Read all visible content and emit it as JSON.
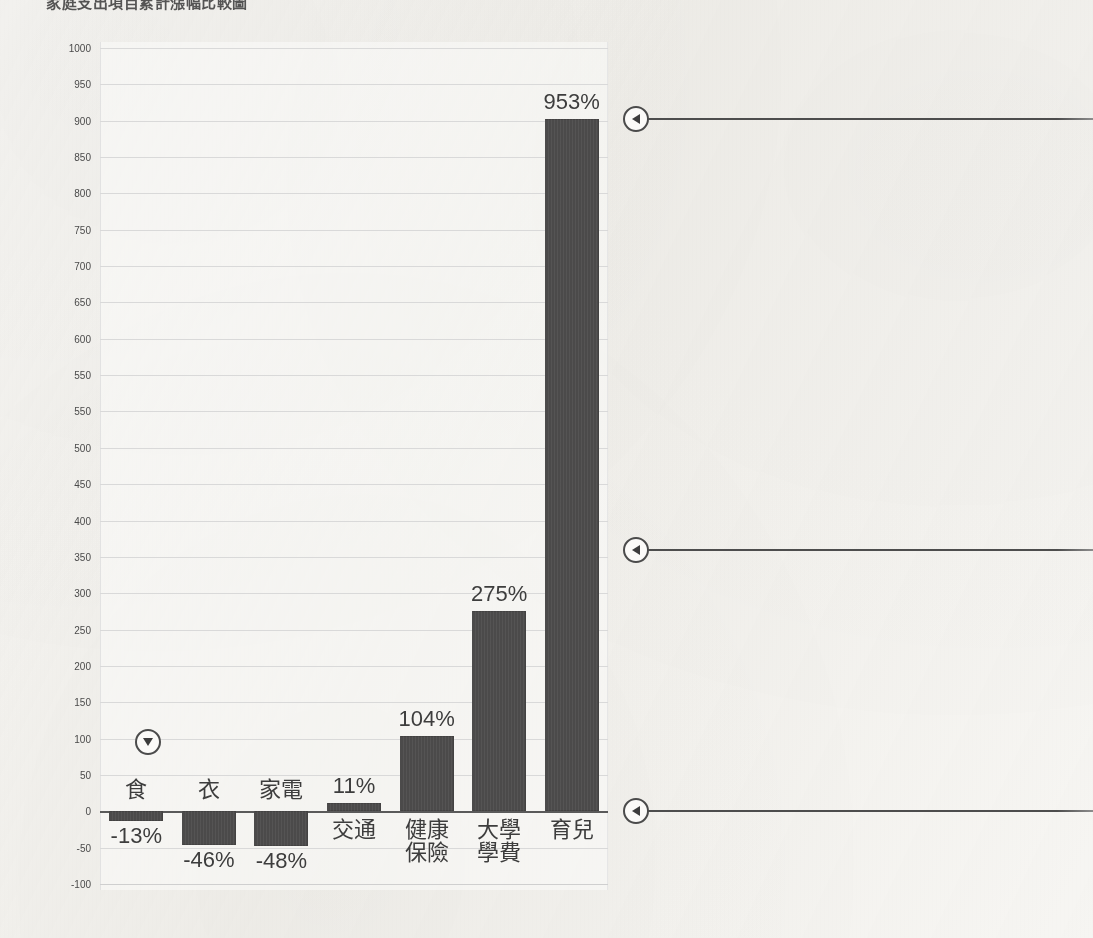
{
  "page": {
    "title_text": "家庭支出項目累計漲幅比較圖",
    "background_color": "#f6f5f2"
  },
  "chart_data": {
    "type": "bar",
    "title": "家庭支出項目累計漲幅比較圖",
    "xlabel": "",
    "ylabel": "",
    "ylim": [
      -100,
      1000
    ],
    "ytick_step": 50,
    "grid": true,
    "legend": "none",
    "bar_color": "#4b4a4a",
    "categories": [
      "食",
      "衣",
      "家電",
      "交通",
      "健康保險",
      "大學學費",
      "育兒"
    ],
    "category_labels": [
      {
        "line1": "食",
        "line2": ""
      },
      {
        "line1": "衣",
        "line2": ""
      },
      {
        "line1": "家電",
        "line2": ""
      },
      {
        "line1": "交通",
        "line2": ""
      },
      {
        "line1": "健康",
        "line2": "保險"
      },
      {
        "line1": "大學",
        "line2": "學費"
      },
      {
        "line1": "育兒",
        "line2": ""
      }
    ],
    "values": [
      -13,
      -46,
      -48,
      11,
      104,
      275,
      953
    ],
    "value_labels": [
      "-13%",
      "-46%",
      "-48%",
      "11%",
      "104%",
      "275%",
      "953%"
    ],
    "ytick_labels": [
      "1000",
      "950",
      "900",
      "850",
      "800",
      "750",
      "700",
      "650",
      "600",
      "550",
      "550",
      "500",
      "450",
      "400",
      "350",
      "300",
      "250",
      "200",
      "150",
      "100",
      "50",
      "0",
      "-50",
      "-100"
    ]
  },
  "annotations": {
    "in_chart_marker": {
      "icon": "circle-triangle-down-icon",
      "value_y": 95
    },
    "callouts": [
      {
        "icon": "circle-triangle-left-icon",
        "value_y": 953
      },
      {
        "icon": "circle-triangle-left-icon",
        "value_y": 360
      },
      {
        "icon": "circle-triangle-left-icon",
        "value_y": 0
      }
    ]
  }
}
